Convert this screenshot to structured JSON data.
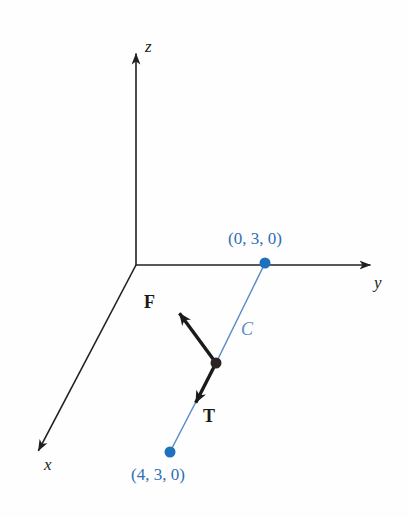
{
  "figure": {
    "background_color": "#fefefe",
    "axis_color": "#231f20",
    "vector_color": "#1a1a1a",
    "accent_blue": "#2f6fb5",
    "curve_blue": "#5b8dc8",
    "dot_blue": "#2070c0",
    "dot_black": "#2b2424"
  },
  "axes": [
    {
      "name": "z-axis",
      "label": "z",
      "origin": [
        136,
        265
      ],
      "tip": [
        136,
        42
      ],
      "label_pos": [
        145,
        38
      ]
    },
    {
      "name": "y-axis",
      "label": "y",
      "origin": [
        136,
        265
      ],
      "tip": [
        382,
        265
      ],
      "label_pos": [
        374,
        274
      ]
    },
    {
      "name": "x-axis",
      "label": "x",
      "origin": [
        136,
        265
      ],
      "tip": [
        33,
        461
      ],
      "label_pos": [
        44,
        456
      ]
    }
  ],
  "points": [
    {
      "name": "point-0-3-0",
      "label": "(0, 3, 0)",
      "color": "#2070c0",
      "cx": 265,
      "cy": 263,
      "r": 5.5,
      "label_pos": [
        228,
        230
      ]
    },
    {
      "name": "point-4-3-0",
      "label": "(4, 3, 0)",
      "color": "#2070c0",
      "cx": 170,
      "cy": 452,
      "r": 5.5,
      "label_pos": [
        131,
        466
      ]
    },
    {
      "name": "point-on-curve",
      "label": "",
      "color": "#2b2424",
      "cx": 216,
      "cy": 363,
      "r": 5.5,
      "label_pos": [
        0,
        0
      ]
    }
  ],
  "curve": {
    "name": "curve-C",
    "label": "C",
    "color": "#5b8dc8",
    "from": [
      265,
      263
    ],
    "via": [
      216,
      363
    ],
    "to": [
      170,
      452
    ],
    "label_pos": [
      241,
      320
    ]
  },
  "vectors": [
    {
      "name": "force-vector-F",
      "label": "F",
      "tail": [
        216,
        363
      ],
      "head": [
        172,
        303
      ],
      "label_pos": [
        144,
        293
      ]
    },
    {
      "name": "tension-vector-T",
      "label": "T",
      "tail": [
        216,
        363
      ],
      "head": [
        190,
        414
      ],
      "label_pos": [
        203,
        407
      ]
    }
  ]
}
